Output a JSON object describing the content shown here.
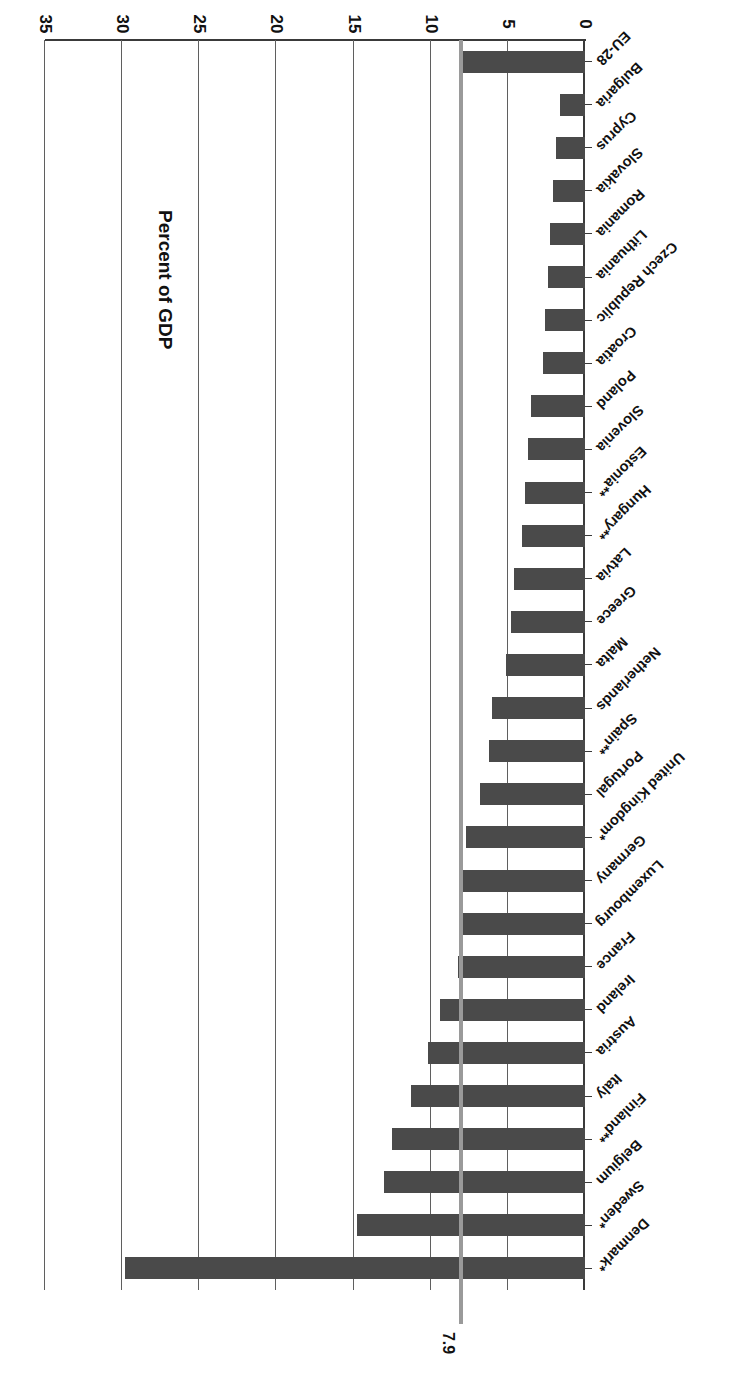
{
  "chart_data": {
    "type": "bar",
    "orientation": "horizontal",
    "title": "",
    "xlabel": "Percent of GDP",
    "ylabel": "",
    "xlim": [
      0,
      35
    ],
    "xticks": [
      "0",
      "5",
      "10",
      "15",
      "20",
      "25",
      "30",
      "35"
    ],
    "xtick_values": [
      0,
      5,
      10,
      15,
      20,
      25,
      30,
      35
    ],
    "grid": true,
    "legend": null,
    "rotation_note": "image is rendered upside down (180 degrees)",
    "reference_line": {
      "label": "7.9",
      "value": 7.9,
      "color": "#9a9a9a"
    },
    "bar_color": "#4a4a4a",
    "categories": [
      "Denmark*",
      "Sweden*",
      "Belgium",
      "Finland**",
      "Italy",
      "Austria",
      "Ireland",
      "France",
      "Luxembourg",
      "Germany",
      "United Kingdom*",
      "Portugal",
      "Spain**",
      "Netherlands",
      "Malta",
      "Greece",
      "Latvia",
      "Hungary**",
      "Estonia**",
      "Slovenia",
      "Poland",
      "Croatia",
      "Czech Republic",
      "Lithuania",
      "Romania",
      "Slovakia",
      "Cyprus",
      "Bulgaria",
      "EU-28"
    ],
    "values": [
      29.8,
      14.8,
      13.0,
      12.5,
      11.3,
      10.2,
      9.4,
      8.2,
      8.1,
      7.9,
      7.7,
      6.8,
      6.2,
      6.0,
      5.1,
      4.8,
      4.6,
      4.1,
      3.9,
      3.7,
      3.5,
      2.7,
      2.6,
      2.4,
      2.3,
      2.1,
      1.9,
      1.6,
      7.9
    ]
  },
  "axis": {
    "value_axis_title": "Percent of GDP"
  }
}
